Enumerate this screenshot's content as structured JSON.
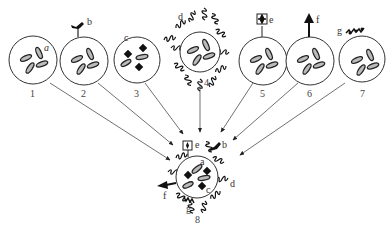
{
  "diagram": {
    "cells": [
      {
        "id": "1",
        "label": "1",
        "feature": "a"
      },
      {
        "id": "2",
        "label": "2",
        "feature": "b"
      },
      {
        "id": "3",
        "label": "3",
        "feature": "c"
      },
      {
        "id": "4",
        "label": "4",
        "feature": "d"
      },
      {
        "id": "5",
        "label": "5",
        "feature": "e"
      },
      {
        "id": "6",
        "label": "6",
        "feature": "f"
      },
      {
        "id": "7",
        "label": "7",
        "feature": "g"
      },
      {
        "id": "8",
        "label": "8",
        "feature": "combined"
      }
    ],
    "feature_letters": {
      "a": "a",
      "b": "b",
      "c": "c",
      "d": "d",
      "e": "e",
      "f": "f",
      "g": "g"
    },
    "colors": {
      "stroke": "#333333",
      "fill_organelle": "#bbbbbb",
      "background": "#ffffff"
    }
  }
}
